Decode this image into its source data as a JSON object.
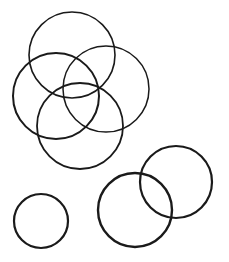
{
  "canvas": {
    "width": 229,
    "height": 262,
    "background": "#ffffff",
    "stroke_color": "#1a1a1a"
  },
  "circles": [
    {
      "id": "top",
      "cx": 72,
      "cy": 55,
      "r": 43,
      "stroke_width": 1.6
    },
    {
      "id": "left",
      "cx": 56,
      "cy": 96,
      "r": 43,
      "stroke_width": 2.0
    },
    {
      "id": "right",
      "cx": 106,
      "cy": 89,
      "r": 43,
      "stroke_width": 1.5
    },
    {
      "id": "bottom-center",
      "cx": 80,
      "cy": 126,
      "r": 43,
      "stroke_width": 1.8
    },
    {
      "id": "small-left",
      "cx": 41,
      "cy": 221,
      "r": 27,
      "stroke_width": 2.2
    },
    {
      "id": "bottom-middle",
      "cx": 135,
      "cy": 210,
      "r": 37,
      "stroke_width": 2.4
    },
    {
      "id": "bottom-right",
      "cx": 176,
      "cy": 182,
      "r": 36,
      "stroke_width": 2.2
    }
  ]
}
